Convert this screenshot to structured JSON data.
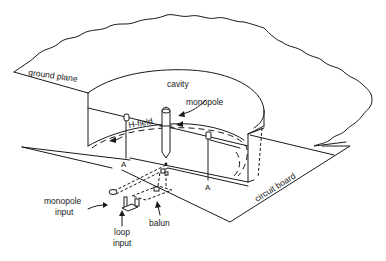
{
  "diagram": {
    "title": "",
    "labels": {
      "ground_plane": "ground plane",
      "cavity": "cavity",
      "monopole": "monopole",
      "h_field": "H-field",
      "section_a_left": "A",
      "section_a_right": "A",
      "circuit_board": "circuit board",
      "monopole_input_line1": "monopole",
      "monopole_input_line2": "input",
      "loop_input_line1": "loop",
      "loop_input_line2": "input",
      "balun": "balun"
    }
  }
}
